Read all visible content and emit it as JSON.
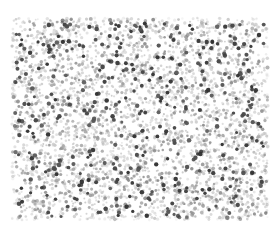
{
  "image": {
    "width": 280,
    "height": 230,
    "background": "#ffffff",
    "description": "Dense field of scattered gray and dark circular dots (speckle texture)"
  },
  "dot_field": {
    "region": {
      "x": 12,
      "y": 18,
      "width": 256,
      "height": 202
    },
    "seed": 1337,
    "layers": [
      {
        "count": 2600,
        "radius_min": 0.9,
        "radius_max": 1.7,
        "gray_min": 185,
        "gray_max": 225,
        "alpha": 0.75
      },
      {
        "count": 900,
        "radius_min": 1.2,
        "radius_max": 1.9,
        "gray_min": 130,
        "gray_max": 175,
        "alpha": 0.85
      },
      {
        "count": 420,
        "radius_min": 1.5,
        "radius_max": 2.3,
        "gray_min": 45,
        "gray_max": 95,
        "alpha": 0.95
      }
    ],
    "edge_fade": 6
  }
}
